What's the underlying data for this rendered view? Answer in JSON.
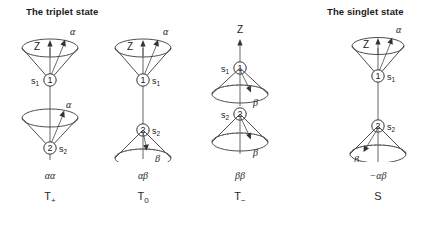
{
  "figure": {
    "width": 434,
    "height": 228,
    "background": "#ffffff",
    "line_color": "#3a3a3a",
    "text_color": "#1a1a1a"
  },
  "headings": {
    "triplet": "The triplet state",
    "singlet": "The singlet state"
  },
  "axis_label": "Z",
  "spin_labels": {
    "s1": "s",
    "s1_sub": "1",
    "s2": "s",
    "s2_sub": "2",
    "one": "1",
    "two": "2"
  },
  "greek": {
    "alpha": "α",
    "beta": "β"
  },
  "columns": [
    {
      "id": "alpha-alpha",
      "group": "triplet",
      "center_x": 50,
      "top_cone": {
        "direction": "up",
        "spin_label": "α",
        "electron": "1",
        "electron_label": "s",
        "electron_sub": "1",
        "label_side": "left"
      },
      "bottom_cone": {
        "direction": "up",
        "spin_label": "α",
        "electron": "2",
        "electron_label": "s",
        "electron_sub": "2",
        "label_side": "right"
      },
      "axis_label_position": "inside",
      "caption_spin": "αα",
      "caption_term": "T",
      "caption_term_sub": "+"
    },
    {
      "id": "alpha-beta",
      "group": "triplet",
      "center_x": 143,
      "top_cone": {
        "direction": "up",
        "spin_label": "α",
        "electron": "1",
        "electron_label": "s",
        "electron_sub": "1",
        "label_side": "right"
      },
      "bottom_cone": {
        "direction": "down",
        "spin_label": "β",
        "electron": "2",
        "electron_label": "s",
        "electron_sub": "2",
        "label_side": "right"
      },
      "axis_label_position": "inside",
      "caption_spin": "αβ",
      "caption_term": "T",
      "caption_term_sub": "0"
    },
    {
      "id": "beta-beta",
      "group": "triplet",
      "center_x": 240,
      "top_cone": {
        "direction": "down",
        "spin_label": "β",
        "electron": "1",
        "electron_label": "s",
        "electron_sub": "1",
        "label_side": "left"
      },
      "bottom_cone": {
        "direction": "down",
        "spin_label": "β",
        "electron": "2",
        "electron_label": "s",
        "electron_sub": "2",
        "label_side": "left"
      },
      "axis_label_position": "above",
      "caption_spin": "ββ",
      "caption_term": "T",
      "caption_term_sub": "−"
    },
    {
      "id": "minus-alpha-beta",
      "group": "singlet",
      "center_x": 378,
      "top_cone": {
        "direction": "up",
        "spin_label": "α",
        "electron": "1",
        "electron_label": "s",
        "electron_sub": "1",
        "label_side": "right"
      },
      "bottom_cone": {
        "direction": "down",
        "spin_label": "β",
        "electron": "2",
        "electron_label": "s",
        "electron_sub": "2",
        "label_side": "right"
      },
      "axis_label_position": "inside",
      "caption_spin": "−αβ",
      "caption_term": "S",
      "caption_term_sub": ""
    }
  ]
}
